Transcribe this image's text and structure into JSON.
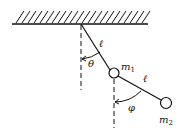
{
  "diagram": {
    "labels": {
      "length_upper": "ℓ",
      "length_lower": "ℓ",
      "angle_upper": "θ",
      "angle_lower": "φ",
      "mass_upper": "m",
      "mass_upper_sub": "1",
      "mass_lower": "m",
      "mass_lower_sub": "2"
    },
    "colors": {
      "ink": "#111111",
      "background": "#ffffff"
    }
  }
}
